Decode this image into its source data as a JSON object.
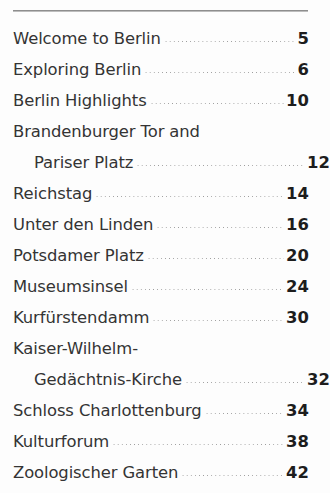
{
  "document": {
    "type": "table-of-contents",
    "divider": "top-rule",
    "text_color": "#343434",
    "page_number_color": "#1d1d1d",
    "leader_color": "#9b9b9b",
    "background": "#fdfdfd"
  },
  "entries": [
    {
      "lines": [
        "Welcome to Berlin"
      ],
      "page": "5"
    },
    {
      "lines": [
        "Exploring Berlin"
      ],
      "page": "6"
    },
    {
      "lines": [
        "Berlin Highlights"
      ],
      "page": "10"
    },
    {
      "lines": [
        "Brandenburger Tor and",
        "Pariser Platz"
      ],
      "page": "12"
    },
    {
      "lines": [
        "Reichstag"
      ],
      "page": "14"
    },
    {
      "lines": [
        "Unter den Linden"
      ],
      "page": "16"
    },
    {
      "lines": [
        "Potsdamer Platz"
      ],
      "page": "20"
    },
    {
      "lines": [
        "Museumsinsel"
      ],
      "page": "24"
    },
    {
      "lines": [
        "Kurfürstendamm"
      ],
      "page": "30"
    },
    {
      "lines": [
        "Kaiser-Wilhelm-",
        "Gedächtnis-Kirche"
      ],
      "page": "32"
    },
    {
      "lines": [
        "Schloss Charlottenburg"
      ],
      "page": "34"
    },
    {
      "lines": [
        "Kulturforum"
      ],
      "page": "38"
    },
    {
      "lines": [
        "Zoologischer Garten"
      ],
      "page": "42"
    }
  ]
}
